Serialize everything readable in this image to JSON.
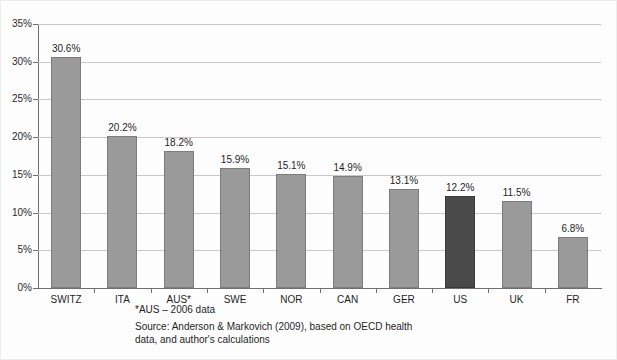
{
  "chart_data": {
    "type": "bar",
    "title": "",
    "subtitle": "",
    "xlabel": "",
    "ylabel": "",
    "ylim": [
      0,
      35
    ],
    "grid": true,
    "legend": "none",
    "categories": [
      "SWITZ",
      "ITA",
      "AUS*",
      "SWE",
      "NOR",
      "CAN",
      "GER",
      "US",
      "UK",
      "FR"
    ],
    "values": [
      30.6,
      20.2,
      18.2,
      15.9,
      15.1,
      14.9,
      13.1,
      12.2,
      11.5,
      6.8
    ],
    "data_labels": [
      "30.6%",
      "20.2%",
      "18.2%",
      "15.9%",
      "15.1%",
      "14.9%",
      "13.1%",
      "12.2%",
      "11.5%",
      "6.8%"
    ],
    "ytick_labels": [
      "35%",
      "30%",
      "25%",
      "20%",
      "15%",
      "10%",
      "5%",
      "0%"
    ],
    "ytick_values": [
      35,
      30,
      25,
      20,
      15,
      10,
      5,
      0
    ],
    "highlight_category": "US",
    "bar_color": "#9a9a9a",
    "highlight_color": "#4a4a4a",
    "grid_color": "#c8c8c8",
    "axis_color": "#6f6f6f",
    "background_color": "#fdfdfd",
    "annotations": [
      "*AUS – 2006 data",
      "Source: Anderson & Markovich (2009), based on OECD health data, and author's calculations"
    ]
  },
  "footnotes": {
    "note": "*AUS – 2006 data",
    "source": "Source: Anderson & Markovich (2009), based on OECD health data, and author's calculations"
  }
}
